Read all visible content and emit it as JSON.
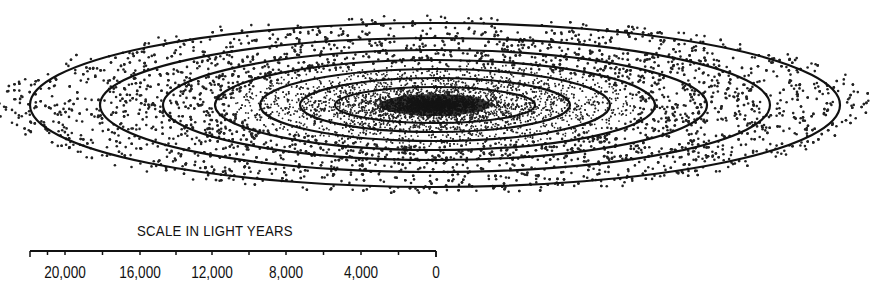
{
  "diagram": {
    "center": {
      "x": 435,
      "y": 105
    },
    "contours": [
      {
        "rx": 405,
        "ry": 82
      },
      {
        "rx": 335,
        "ry": 67
      },
      {
        "rx": 272,
        "ry": 55
      },
      {
        "rx": 220,
        "ry": 45
      },
      {
        "rx": 175,
        "ry": 36
      },
      {
        "rx": 135,
        "ry": 27
      },
      {
        "rx": 100,
        "ry": 18
      }
    ],
    "line_color": "#111111"
  },
  "scale": {
    "title": "SCALE IN LIGHT YEARS",
    "ticks": [
      {
        "label": "20,000",
        "x": 65
      },
      {
        "label": "16,000",
        "x": 140
      },
      {
        "label": "12,000",
        "x": 212
      },
      {
        "label": "8,000",
        "x": 286
      },
      {
        "label": "4,000",
        "x": 361
      },
      {
        "label": "0",
        "x": 436
      }
    ],
    "bar": {
      "x1": 30,
      "x2": 436
    }
  }
}
